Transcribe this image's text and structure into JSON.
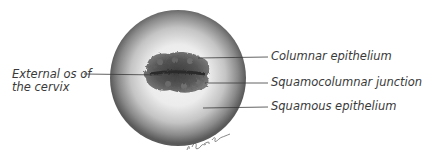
{
  "diagram": {
    "labels": {
      "external_os": [
        "External os of",
        "the cervix"
      ],
      "columnar": "Columnar epithelium",
      "junction": "Squamocolumnar junction",
      "squamous": "Squamous epithelium"
    },
    "signature": "artist signature"
  },
  "colors": {
    "ring_outer": "#5a5a5a",
    "ring_inner": "#efefef",
    "os_dark": "#3c3c3c",
    "os_mid": "#6e6e6e",
    "leader_line": "#3a3a3a",
    "text": "#3a3a3a"
  }
}
